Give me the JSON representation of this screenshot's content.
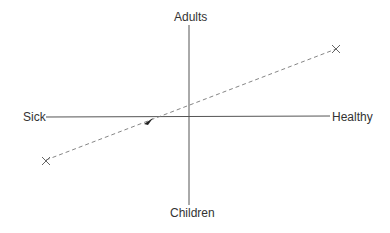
{
  "axes": {
    "top_label": "Adults",
    "bottom_label": "Children",
    "left_label": "Sick",
    "right_label": "Healthy"
  },
  "trajectory": {
    "start_marker": "x-marker",
    "end_marker": "x-marker",
    "line_style": "dashed",
    "direction_arrow": "arrow-icon"
  },
  "colors": {
    "axis": "#555555",
    "trajectory": "#777777",
    "text": "#333333"
  }
}
